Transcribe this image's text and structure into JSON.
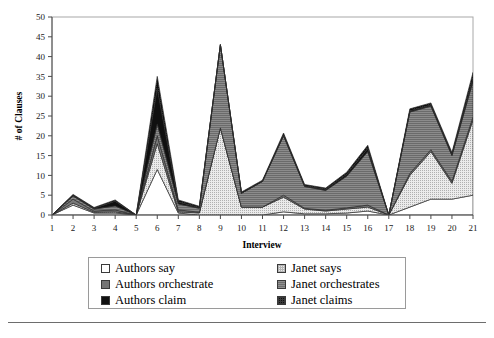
{
  "chart_data": {
    "type": "area",
    "stacked": true,
    "title": "",
    "subtitle": "",
    "xlabel": "Interview",
    "ylabel": "# of Clauses",
    "xlim": [
      1,
      21
    ],
    "ylim": [
      0,
      50
    ],
    "yticks": [
      0,
      5,
      10,
      15,
      20,
      25,
      30,
      35,
      40,
      45,
      50
    ],
    "grid": false,
    "legend_position": "below-plot",
    "categories": [
      1,
      2,
      3,
      4,
      5,
      6,
      7,
      8,
      9,
      10,
      11,
      12,
      13,
      14,
      15,
      16,
      17,
      18,
      19,
      20,
      21
    ],
    "x_tick_labels": [
      "1",
      "2",
      "3",
      "4",
      "5",
      "6",
      "7",
      "8",
      "9",
      "10",
      "11",
      "12",
      "13",
      "14",
      "15",
      "16",
      "17",
      "18",
      "19",
      "20",
      "21"
    ],
    "y_tick_labels": [
      "0",
      "5",
      "10",
      "15",
      "20",
      "25",
      "30",
      "35",
      "40",
      "45",
      "50"
    ],
    "series": [
      {
        "name": "Authors say",
        "fill": "#ffffff",
        "pattern": "solid-white",
        "values": [
          0,
          2.5,
          0.5,
          0.5,
          0,
          11.5,
          0.5,
          0,
          0,
          0,
          0,
          0.8,
          0.3,
          0.3,
          0.5,
          1.0,
          0,
          2.0,
          4.0,
          4.0,
          5.0
        ]
      },
      {
        "name": "Janet says",
        "fill": "#dcdcdc",
        "pattern": "fine-dots",
        "values": [
          0,
          0.5,
          0.2,
          0.3,
          0,
          6.5,
          0.3,
          0.5,
          22.0,
          2.0,
          2.0,
          3.7,
          1.2,
          0.7,
          1.0,
          1.0,
          0,
          8.0,
          12.0,
          4.0,
          19.0
        ]
      },
      {
        "name": "Authors orchestrate",
        "fill": "#7a7a7a",
        "pattern": "solid-gray",
        "values": [
          0,
          1.0,
          0.3,
          0.5,
          0,
          2.0,
          0.5,
          0.2,
          0,
          0,
          0,
          0.5,
          0.2,
          0.2,
          0.3,
          0.5,
          0,
          0.5,
          0.5,
          0.5,
          0.8
        ]
      },
      {
        "name": "Janet orchestrates",
        "fill": "#6b6b6b",
        "pattern": "horizontal-hatch",
        "values": [
          0,
          0.8,
          0.5,
          1.0,
          0,
          3.0,
          1.5,
          1.0,
          21.0,
          3.5,
          6.5,
          15.0,
          5.5,
          5.0,
          8.0,
          13.5,
          0,
          15.5,
          11.0,
          6.5,
          9.0
        ]
      },
      {
        "name": "Authors claim",
        "fill": "#101010",
        "pattern": "solid-black",
        "values": [
          0,
          0.2,
          0.2,
          1.2,
          0,
          9.0,
          0.5,
          0.2,
          0,
          0,
          0,
          0.2,
          0.2,
          0.3,
          0.5,
          0.8,
          0,
          0.3,
          0.3,
          0.3,
          0.8
        ]
      },
      {
        "name": "Janet claims",
        "fill": "#0d0d0d",
        "pattern": "dotted-black",
        "values": [
          0,
          0.2,
          0.2,
          0.3,
          0,
          3.0,
          0.5,
          0.3,
          0,
          0.3,
          0.3,
          0.5,
          0.3,
          0.3,
          0.5,
          0.8,
          0,
          0.5,
          0.5,
          0.5,
          1.4
        ]
      }
    ],
    "series_totals": [
      0,
      5.2,
      1.9,
      3.8,
      0,
      35.0,
      3.8,
      2.2,
      43.0,
      5.8,
      8.8,
      20.7,
      7.7,
      6.8,
      10.8,
      17.6,
      0,
      26.8,
      28.3,
      15.8,
      36.0
    ]
  },
  "legend": {
    "entries": [
      {
        "label": "Authors say",
        "swatch": "sw-authors-say",
        "name": "legend-swatch-authors-say"
      },
      {
        "label": "Janet says",
        "swatch": "sw-janet-says",
        "name": "legend-swatch-janet-says"
      },
      {
        "label": "Authors orchestrate",
        "swatch": "sw-authors-orch",
        "name": "legend-swatch-authors-orchestrate"
      },
      {
        "label": "Janet orchestrates",
        "swatch": "sw-janet-orch",
        "name": "legend-swatch-janet-orchestrates"
      },
      {
        "label": "Authors claim",
        "swatch": "sw-authors-claim",
        "name": "legend-swatch-authors-claim"
      },
      {
        "label": "Janet claims",
        "swatch": "sw-janet-claim",
        "name": "legend-swatch-janet-claims"
      }
    ]
  },
  "colors": {
    "axis": "#9a9a9a",
    "text": "#000000",
    "rule": "#6d6d6d",
    "authors_say": "#ffffff",
    "janet_says": "#dcdcdc",
    "authors_orchestrate": "#7a7a7a",
    "janet_orchestrates": "#6b6b6b",
    "authors_claim": "#101010",
    "janet_claims": "#0d0d0d"
  }
}
